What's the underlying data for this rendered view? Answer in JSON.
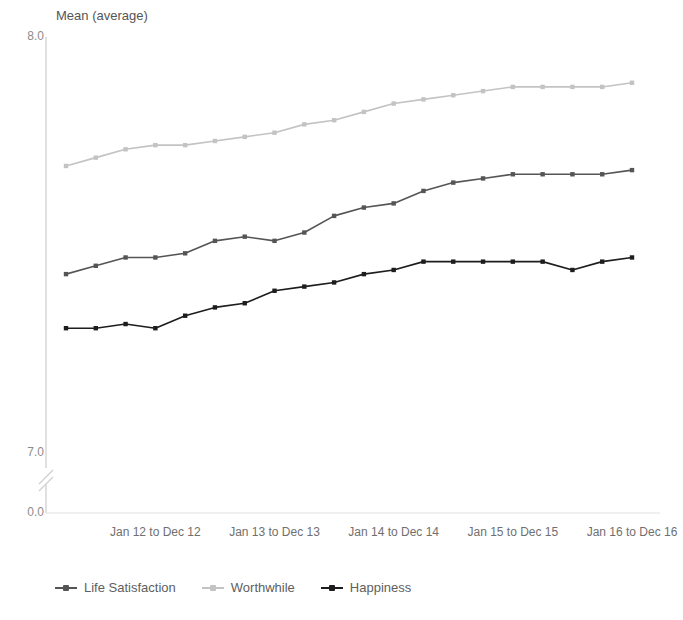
{
  "chart_data": {
    "type": "line",
    "title": "",
    "ylabel": "Mean (average)",
    "xlabel": "",
    "ylim": [
      7.0,
      8.0
    ],
    "yticks": [
      "8.0",
      "7.0",
      "0.0"
    ],
    "axis_break": true,
    "grid": false,
    "legend_position": "bottom-left",
    "x_tick_labels": [
      "Jan 12 to Dec 12",
      "Jan 13 to Dec 13",
      "Jan 14 to Dec 14",
      "Jan 15 to Dec 15",
      "Jan 16 to Dec 16"
    ],
    "x_tick_indices": [
      3,
      7,
      11,
      15,
      19
    ],
    "x": [
      "Jan 11 to Dec 11",
      "Apr 11 to Mar 12",
      "Jul 11 to Jun 12",
      "Jan 12 to Dec 12",
      "Apr 12 to Mar 13",
      "Jul 12 to Jun 13",
      "Oct 12 to Sep 13",
      "Jan 13 to Dec 13",
      "Apr 13 to Mar 14",
      "Jul 13 to Jun 14",
      "Oct 13 to Sep 14",
      "Jan 14 to Dec 14",
      "Apr 14 to Mar 15",
      "Jul 14 to Jun 15",
      "Oct 14 to Sep 15",
      "Jan 15 to Dec 15",
      "Apr 15 to Mar 16",
      "Jul 15 to Jun 16",
      "Oct 15 to Sep 16",
      "Jan 16 to Dec 16"
    ],
    "series": [
      {
        "name": "Life Satisfaction",
        "color": "#555555",
        "values": [
          7.43,
          7.45,
          7.47,
          7.47,
          7.48,
          7.51,
          7.52,
          7.51,
          7.53,
          7.57,
          7.59,
          7.6,
          7.63,
          7.65,
          7.66,
          7.67,
          7.67,
          7.67,
          7.67,
          7.68
        ]
      },
      {
        "name": "Worthwhile",
        "color": "#c3c3c3",
        "values": [
          7.69,
          7.71,
          7.73,
          7.74,
          7.74,
          7.75,
          7.76,
          7.77,
          7.79,
          7.8,
          7.82,
          7.84,
          7.85,
          7.86,
          7.87,
          7.88,
          7.88,
          7.88,
          7.88,
          7.89
        ]
      },
      {
        "name": "Happiness",
        "color": "#1d1d1d",
        "values": [
          7.3,
          7.3,
          7.31,
          7.3,
          7.33,
          7.35,
          7.36,
          7.39,
          7.4,
          7.41,
          7.43,
          7.44,
          7.46,
          7.46,
          7.46,
          7.46,
          7.46,
          7.44,
          7.46,
          7.47
        ]
      }
    ]
  },
  "axes": {
    "plot_left": 46,
    "plot_right": 660,
    "first_point_x": 66,
    "last_point_x": 632,
    "y_top_value": 8.0,
    "y_top_px": 37,
    "y_mid_value": 7.0,
    "y_mid_px": 453,
    "y_zero_px": 513,
    "break_px": 478
  }
}
